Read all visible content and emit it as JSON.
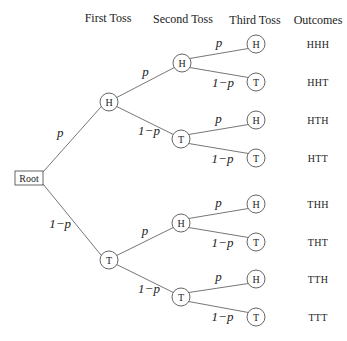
{
  "headers": {
    "first": "First Toss",
    "second": "Second Toss",
    "third": "Third Toss",
    "outcomes": "Outcomes"
  },
  "root": {
    "label": "Root",
    "x": 29,
    "y": 178
  },
  "labels": {
    "p": "p",
    "q": "1−p"
  },
  "first_toss": [
    {
      "id": "H",
      "label": "H",
      "x": 109,
      "y": 102,
      "edge_label": "p"
    },
    {
      "id": "T",
      "label": "T",
      "x": 109,
      "y": 260,
      "edge_label": "1−p"
    }
  ],
  "second_toss": [
    {
      "label": "H",
      "x": 182,
      "y": 63,
      "parent": 0,
      "edge_label": "p"
    },
    {
      "label": "T",
      "x": 181,
      "y": 139,
      "parent": 0,
      "edge_label": "1−p"
    },
    {
      "label": "H",
      "x": 181,
      "y": 223,
      "parent": 1,
      "edge_label": "p"
    },
    {
      "label": "T",
      "x": 181,
      "y": 297,
      "parent": 1,
      "edge_label": "1−p"
    }
  ],
  "third_toss": [
    {
      "label": "H",
      "x": 256,
      "y": 44,
      "parent": 0,
      "edge_label": "p"
    },
    {
      "label": "T",
      "x": 256,
      "y": 82,
      "parent": 0,
      "edge_label": "1−p"
    },
    {
      "label": "H",
      "x": 256,
      "y": 120,
      "parent": 1,
      "edge_label": "p"
    },
    {
      "label": "T",
      "x": 256,
      "y": 158,
      "parent": 1,
      "edge_label": "1−p"
    },
    {
      "label": "H",
      "x": 256,
      "y": 204,
      "parent": 2,
      "edge_label": "p"
    },
    {
      "label": "T",
      "x": 256,
      "y": 242,
      "parent": 2,
      "edge_label": "1−p"
    },
    {
      "label": "H",
      "x": 256,
      "y": 279,
      "parent": 3,
      "edge_label": "p"
    },
    {
      "label": "T",
      "x": 256,
      "y": 317,
      "parent": 3,
      "edge_label": "1−p"
    }
  ],
  "outcomes": [
    "HHH",
    "HHT",
    "HTH",
    "HTT",
    "THH",
    "THT",
    "TTH",
    "TTT"
  ]
}
